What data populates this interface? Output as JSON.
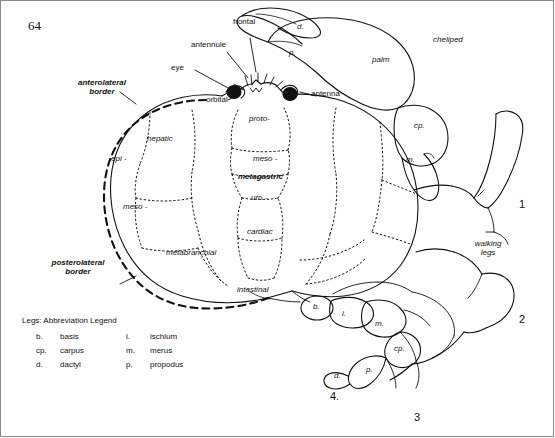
{
  "page": {
    "number": "64"
  },
  "figure": {
    "labels": {
      "frontal": "frontal",
      "antennule": "antennule",
      "eye": "eye",
      "orbital": "orbital",
      "antenna": "antenna",
      "anterolateral_border": "anterolateral\nborder",
      "posterolateral_border": "posterolateral\nborder",
      "hepatic": "hepatic",
      "epi": "epi -",
      "meso_left": "meso -",
      "metabranchial": "metabranchial",
      "proto": "proto-",
      "meso_mid": "meso -",
      "metagastric": "metagastric",
      "uro": "uro -",
      "cardiac": "cardiac",
      "intestinal": "intestinal",
      "cheliped": "cheliped",
      "palm": "palm",
      "walking_legs": "walking\nlegs",
      "d_claw": "d.",
      "p_claw": "p.",
      "cp_cheliped": "cp.",
      "m_cheliped": "m.",
      "b_leg": "b.",
      "i_leg": "i.",
      "m_leg": "m.",
      "cp_leg": "cp.",
      "p_leg": "p.",
      "d_leg": "d.",
      "leg1": "1",
      "leg2": "2",
      "leg3": "3",
      "leg4": "4."
    }
  },
  "legend": {
    "title": "Legs: Abbreviation Legend",
    "rows": [
      {
        "abbr": "b.",
        "word": "basis",
        "abbr2": "i.",
        "word2": "ischium"
      },
      {
        "abbr": "cp.",
        "word": "carpus",
        "abbr2": "m.",
        "word2": "merus"
      },
      {
        "abbr": "d.",
        "word": "dactyl",
        "abbr2": "p.",
        "word2": "propodus"
      }
    ]
  }
}
